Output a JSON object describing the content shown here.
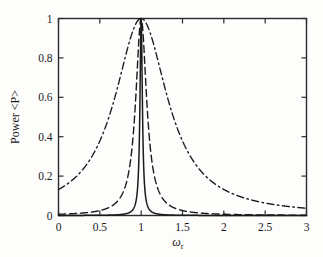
{
  "chart_data": {
    "type": "line",
    "title": "",
    "xlabel": "ω",
    "xlabel_sub": "r",
    "ylabel": "Power <P>",
    "xlim": [
      0,
      3
    ],
    "ylim": [
      0,
      1
    ],
    "xticks": [
      "0",
      "0.5",
      "1",
      "1.5",
      "2",
      "2.5",
      "3"
    ],
    "xtick_values": [
      0,
      0.5,
      1,
      1.5,
      2,
      2.5,
      3
    ],
    "yticks": [
      "0",
      "0.2",
      "0.4",
      "0.6",
      "0.8",
      "1"
    ],
    "ytick_values": [
      0,
      0.2,
      0.4,
      0.6,
      0.8,
      1
    ],
    "grid": false,
    "legend": "none",
    "frame": "box",
    "tick_direction": "in",
    "line_color": "#1a1a1a",
    "series": [
      {
        "name": "high-Q resonance",
        "style": "solid",
        "peak_x": 1,
        "peak_y": 1,
        "fwhm": 0.035,
        "values": [
          0.0001,
          0.0002,
          0.0003,
          0.0005,
          0.0008,
          0.0014,
          0.0031,
          0.0121,
          0.1651,
          1.0,
          0.1651,
          0.0121,
          0.0031,
          0.0014,
          0.0008,
          0.0005,
          0.0003,
          0.0002,
          0.0001
        ]
      },
      {
        "name": "medium-Q resonance",
        "style": "dashed",
        "peak_x": 1,
        "peak_y": 1,
        "fwhm": 0.16,
        "values": [
          0.0063,
          0.0074,
          0.0089,
          0.0109,
          0.0137,
          0.0178,
          0.0242,
          0.0353,
          0.0577,
          0.1111,
          0.2581,
          0.64,
          1.0,
          0.64,
          0.2581,
          0.1111,
          0.0577,
          0.0353,
          0.0242,
          0.0178,
          0.0137,
          0.0109,
          0.0089,
          0.0074,
          0.0063
        ]
      },
      {
        "name": "low-Q resonance",
        "style": "dashdot",
        "peak_x": 1,
        "peak_y": 1,
        "fwhm": 0.78,
        "values": [
          0.02,
          0.03,
          0.045,
          0.07,
          0.11,
          0.18,
          0.3,
          0.5,
          0.78,
          1.0,
          0.78,
          0.5,
          0.34,
          0.25,
          0.195,
          0.16,
          0.135,
          0.12,
          0.115
        ]
      }
    ]
  }
}
